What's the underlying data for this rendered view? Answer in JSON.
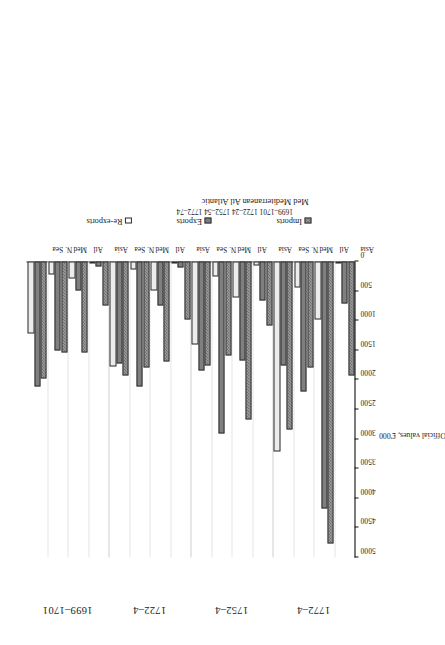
{
  "figure": {
    "axis_title": "Official values, £'000",
    "legend_position": "right",
    "abbrev_key": "Med Mediterranean    Atl Atlantic",
    "period_key": "1699–1701  1722–24  1752–54  1772–74"
  },
  "legend": [
    {
      "label": "Imports",
      "pattern": "imports"
    },
    {
      "label": "Exports",
      "pattern": "exports"
    },
    {
      "label": "Re-exports",
      "pattern": "reexports"
    }
  ],
  "periods": [
    "1699–1701",
    "1722–4",
    "1752–4",
    "1772–4"
  ],
  "regions": [
    "N. Sea",
    "Med",
    "Atl",
    "Asia"
  ],
  "chart_data": {
    "type": "bar",
    "orientation": "horizontal",
    "title": "",
    "xlabel": "Official values, £'000",
    "ylabel": "",
    "xlim": [
      0,
      5000
    ],
    "xticks": [
      5000,
      4500,
      4000,
      3500,
      3000,
      2500,
      2000,
      1500,
      1000,
      500,
      0
    ],
    "xtick_labels": [
      "5000",
      "4500",
      "4000",
      "3500",
      "3000",
      "2500",
      "2000",
      "1500",
      "1000",
      "500",
      "0"
    ],
    "axis_reversed": true,
    "grid": true,
    "legend": [
      "Imports",
      "Exports",
      "Re-exports"
    ],
    "group_labels": [
      "1699–1701",
      "1722–4",
      "1752–4",
      "1772–4"
    ],
    "categories": [
      "N. Sea",
      "Med",
      "Atl",
      "Asia"
    ],
    "groups": [
      {
        "period": "1699–1701",
        "bars": [
          {
            "region": "N. Sea",
            "imports": 1973,
            "exports": 2108,
            "reexports": 1214
          },
          {
            "region": "Med",
            "imports": 1535,
            "exports": 1501,
            "reexports": 219
          },
          {
            "region": "Atl",
            "imports": 1535,
            "exports": 489,
            "reexports": 287
          },
          {
            "region": "Asia",
            "imports": 742,
            "exports": 84,
            "reexports": 17
          }
        ]
      },
      {
        "period": "1722–4",
        "bars": [
          {
            "region": "N. Sea",
            "imports": 1923,
            "exports": 1720,
            "reexports": 1771
          },
          {
            "region": "Med",
            "imports": 1787,
            "exports": 2108,
            "reexports": 135
          },
          {
            "region": "Atl",
            "imports": 1686,
            "exports": 742,
            "reexports": 489
          },
          {
            "region": "Asia",
            "imports": 978,
            "exports": 101,
            "reexports": 34
          }
        ]
      },
      {
        "period": "1752–4",
        "bars": [
          {
            "region": "N. Sea",
            "imports": 1754,
            "exports": 1838,
            "reexports": 1400
          },
          {
            "region": "Med",
            "imports": 1585,
            "exports": 2900,
            "reexports": 253
          },
          {
            "region": "Atl",
            "imports": 2664,
            "exports": 1670,
            "reexports": 607
          },
          {
            "region": "Asia",
            "imports": 1079,
            "exports": 658,
            "reexports": 67
          }
        ]
      },
      {
        "period": "1772–4",
        "bars": [
          {
            "region": "N. Sea",
            "imports": 2833,
            "exports": 1754,
            "reexports": 3204
          },
          {
            "region": "Med",
            "imports": 1787,
            "exports": 2192,
            "reexports": 438
          },
          {
            "region": "Atl",
            "imports": 4772,
            "exports": 4165,
            "reexports": 978
          },
          {
            "region": "Asia",
            "imports": 1923,
            "exports": 709,
            "reexports": 17
          }
        ]
      }
    ]
  }
}
